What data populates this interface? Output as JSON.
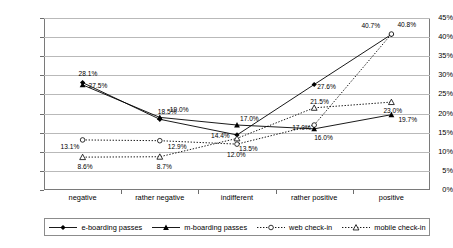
{
  "chart_data": {
    "type": "line",
    "title": "",
    "xlabel": "",
    "ylabel": "",
    "categories": [
      "negative",
      "rather negative",
      "indifferent",
      "rather positive",
      "positive"
    ],
    "ylim": [
      0,
      45
    ],
    "ytick_labels": [
      "0%",
      "5%",
      "10%",
      "15%",
      "20%",
      "25%",
      "30%",
      "35%",
      "40%",
      "45%"
    ],
    "ytick_values": [
      0,
      5,
      10,
      15,
      20,
      25,
      30,
      35,
      40,
      45
    ],
    "grid": true,
    "legend_position": "bottom",
    "series": [
      {
        "name": "e-boarding passes",
        "marker": "filled-diamond",
        "line_style": "solid",
        "color": "#000000",
        "values": [
          28.1,
          18.5,
          14.4,
          27.6,
          40.7
        ],
        "labels": [
          "28.1%",
          "18.5%",
          "14.4%",
          "27.6%",
          "40.7%"
        ]
      },
      {
        "name": "m-boarding passes",
        "marker": "filled-triangle",
        "line_style": "solid",
        "color": "#000000",
        "values": [
          27.5,
          19.0,
          17.0,
          16.0,
          19.7
        ],
        "labels": [
          "27.5%",
          "19.0%",
          "17.0%",
          "16.0%",
          "19.7%"
        ]
      },
      {
        "name": "web check-in",
        "marker": "open-circle",
        "line_style": "dotted",
        "color": "#000000",
        "values": [
          13.1,
          12.9,
          12.0,
          17.0,
          40.8
        ],
        "labels": [
          "13.1%",
          "12.9%",
          "12.0%",
          "17.0%",
          "40.8%"
        ]
      },
      {
        "name": "mobile check-in",
        "marker": "open-triangle",
        "line_style": "dotted",
        "color": "#000000",
        "values": [
          8.6,
          8.7,
          13.5,
          21.5,
          23.0
        ],
        "labels": [
          "8.6%",
          "8.7%",
          "13.5%",
          "21.5%",
          "23.0%"
        ]
      }
    ]
  },
  "legend": {
    "items": [
      {
        "label": "e-boarding passes"
      },
      {
        "label": "m-boarding passes"
      },
      {
        "label": "web check-in"
      },
      {
        "label": "mobile check-in"
      }
    ]
  }
}
